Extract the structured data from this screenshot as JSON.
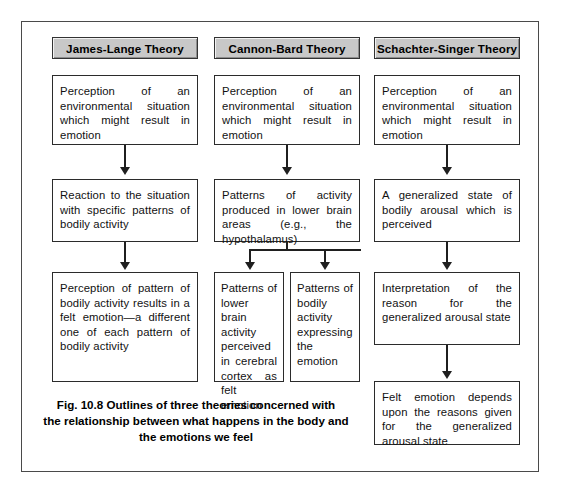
{
  "figure": {
    "caption_lines": [
      "Fig. 10.8 Outlines of three theories concerned with",
      "the relationship between what happens in the body and",
      "the emotions we feel"
    ],
    "frame_color": "#4a4a4a",
    "box_border_color": "#2b2b2b",
    "tab_fill_color": "#c8c8c8"
  },
  "columns": [
    {
      "id": "james-lange",
      "title": "James-Lange Theory",
      "steps": [
        "Perception of an environmental situation which might result in emotion",
        "Reaction to the situation with specific patterns of bodily activity",
        "Perception of pattern of bodily activity results in a felt emotion—a different one of each pattern of bodily activity"
      ]
    },
    {
      "id": "cannon-bard",
      "title": "Cannon-Bard Theory",
      "steps": [
        "Perception of an environmental situation which might result in emotion",
        "Patterns of activity produced in lower brain areas (e.g., the hypothalamus)"
      ],
      "branches": [
        "Patterns of lower brain activity perceived in cerebral cortex as felt emotion",
        "Patterns of bodily activity expressing the emotion"
      ]
    },
    {
      "id": "schachter-singer",
      "title": "Schachter-Singer Theory",
      "steps": [
        "Perception of an environmental situation which might result in emotion",
        "A generalized state of bodily arousal which is perceived",
        "Interpretation of the reason for the generalized arousal state",
        "Felt emotion depends upon the reasons given for the generalized arousal state"
      ]
    }
  ]
}
